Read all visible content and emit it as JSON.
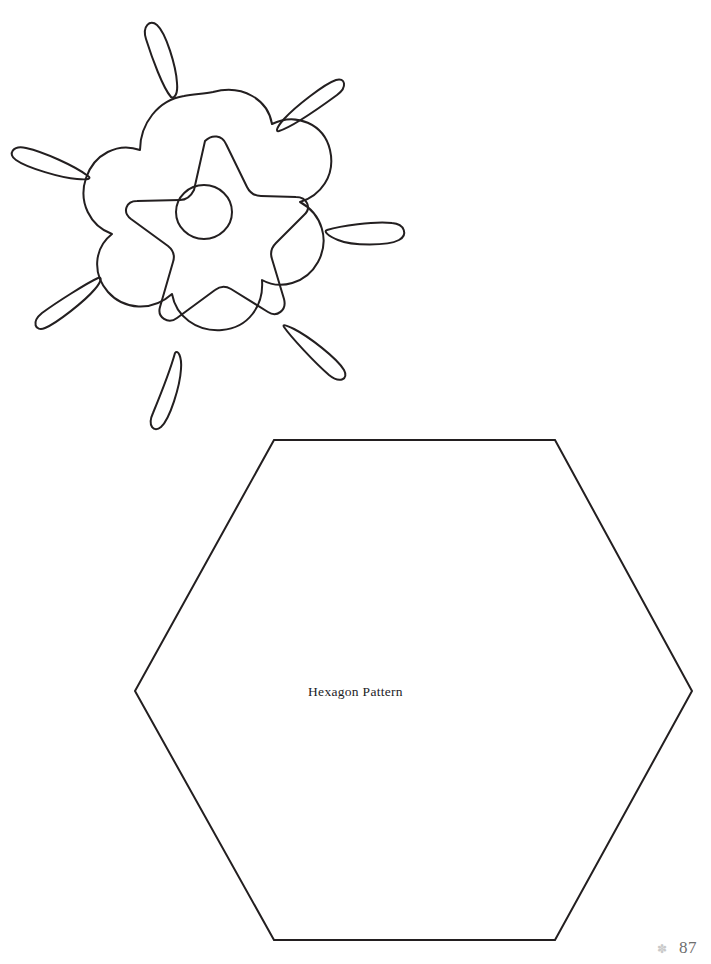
{
  "page": {
    "background_color": "#ffffff",
    "ink_color": "#231f20",
    "width": 711,
    "height": 964
  },
  "artwork": {
    "flower": {
      "name": "flower-star-burst",
      "description": "Six-lobed flower outline with a rounded five-point star and a circle at its center, surrounded by seven radiating teardrop sparkles",
      "center": {
        "x": 213,
        "y": 218
      },
      "stroke_color": "#231f20",
      "stroke_width": 2,
      "lobe_count": 6,
      "star_points": 5,
      "sparkle_count": 7
    },
    "hexagon": {
      "name": "hexagon-outline",
      "stroke_color": "#231f20",
      "stroke_width": 2,
      "orientation": "flat-top",
      "vertices": [
        {
          "x": 274,
          "y": 440
        },
        {
          "x": 555,
          "y": 440
        },
        {
          "x": 692,
          "y": 691
        },
        {
          "x": 555,
          "y": 940
        },
        {
          "x": 274,
          "y": 940
        },
        {
          "x": 135,
          "y": 691
        }
      ]
    }
  },
  "labels": {
    "hexagon_caption": "Hexagon Pattern"
  },
  "folio": {
    "mark_glyph": "✽",
    "page_number": "87",
    "mark_color": "#c9c9c9",
    "number_color": "#6e6e6e"
  }
}
